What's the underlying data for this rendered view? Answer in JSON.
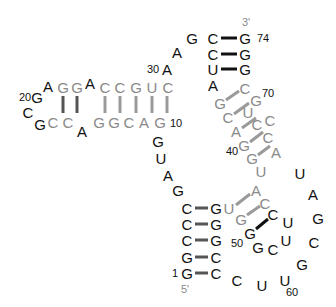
{
  "diagram": {
    "type": "RNA secondary structure (tRNA-like)",
    "colors": {
      "black": "#111111",
      "grey": "#8a8a8a",
      "bond_dark": "#555555",
      "bond_black": "#111111",
      "bond_grey": "#9a9a9a"
    },
    "ends": [
      {
        "label": "3'",
        "x": 246,
        "y": 22
      },
      {
        "label": "5'",
        "x": 185,
        "y": 289
      }
    ],
    "numbers": [
      {
        "label": "74",
        "x": 263,
        "y": 38
      },
      {
        "label": "30",
        "x": 153,
        "y": 69
      },
      {
        "label": "70",
        "x": 268,
        "y": 93
      },
      {
        "label": "20",
        "x": 25,
        "y": 97
      },
      {
        "label": "10",
        "x": 176,
        "y": 123
      },
      {
        "label": "40",
        "x": 232,
        "y": 151
      },
      {
        "label": "50",
        "x": 237,
        "y": 243
      },
      {
        "label": "1",
        "x": 175,
        "y": 273
      },
      {
        "label": "60",
        "x": 292,
        "y": 292
      }
    ],
    "nucleotides": [
      {
        "b": "G",
        "x": 187,
        "y": 273,
        "c": "black"
      },
      {
        "b": "G",
        "x": 187,
        "y": 257,
        "c": "black"
      },
      {
        "b": "C",
        "x": 187,
        "y": 240,
        "c": "black"
      },
      {
        "b": "C",
        "x": 187,
        "y": 224,
        "c": "black"
      },
      {
        "b": "C",
        "x": 187,
        "y": 208,
        "c": "black"
      },
      {
        "b": "G",
        "x": 178,
        "y": 190,
        "c": "black"
      },
      {
        "b": "A",
        "x": 168,
        "y": 175,
        "c": "black"
      },
      {
        "b": "U",
        "x": 161,
        "y": 158,
        "c": "black"
      },
      {
        "b": "G",
        "x": 158,
        "y": 141,
        "c": "black"
      },
      {
        "b": "G",
        "x": 160,
        "y": 122,
        "c": "grey"
      },
      {
        "b": "A",
        "x": 144,
        "y": 122,
        "c": "grey"
      },
      {
        "b": "C",
        "x": 129,
        "y": 122,
        "c": "grey"
      },
      {
        "b": "G",
        "x": 114,
        "y": 122,
        "c": "grey"
      },
      {
        "b": "G",
        "x": 99,
        "y": 122,
        "c": "grey"
      },
      {
        "b": "A",
        "x": 82,
        "y": 131,
        "c": "black"
      },
      {
        "b": "C",
        "x": 68,
        "y": 122,
        "c": "grey"
      },
      {
        "b": "C",
        "x": 53,
        "y": 122,
        "c": "grey"
      },
      {
        "b": "G",
        "x": 40,
        "y": 124,
        "c": "black"
      },
      {
        "b": "C",
        "x": 28,
        "y": 112,
        "c": "black"
      },
      {
        "b": "G",
        "x": 37,
        "y": 97,
        "c": "black"
      },
      {
        "b": "A",
        "x": 48,
        "y": 86,
        "c": "black"
      },
      {
        "b": "G",
        "x": 63,
        "y": 87,
        "c": "grey"
      },
      {
        "b": "G",
        "x": 77,
        "y": 87,
        "c": "grey"
      },
      {
        "b": "A",
        "x": 90,
        "y": 83,
        "c": "black"
      },
      {
        "b": "C",
        "x": 105,
        "y": 87,
        "c": "grey"
      },
      {
        "b": "C",
        "x": 120,
        "y": 87,
        "c": "grey"
      },
      {
        "b": "G",
        "x": 136,
        "y": 87,
        "c": "grey"
      },
      {
        "b": "U",
        "x": 152,
        "y": 87,
        "c": "grey"
      },
      {
        "b": "C",
        "x": 168,
        "y": 87,
        "c": "grey"
      },
      {
        "b": "A",
        "x": 167,
        "y": 69,
        "c": "black"
      },
      {
        "b": "A",
        "x": 177,
        "y": 52,
        "c": "black"
      },
      {
        "b": "G",
        "x": 192,
        "y": 38,
        "c": "black"
      },
      {
        "b": "C",
        "x": 213,
        "y": 38,
        "c": "black"
      },
      {
        "b": "C",
        "x": 213,
        "y": 54,
        "c": "black"
      },
      {
        "b": "U",
        "x": 213,
        "y": 69,
        "c": "black"
      },
      {
        "b": "A",
        "x": 213,
        "y": 85,
        "c": "black"
      },
      {
        "b": "G",
        "x": 220,
        "y": 103,
        "c": "grey"
      },
      {
        "b": "C",
        "x": 228,
        "y": 117,
        "c": "grey"
      },
      {
        "b": "A",
        "x": 236,
        "y": 131,
        "c": "grey"
      },
      {
        "b": "G",
        "x": 244,
        "y": 145,
        "c": "grey"
      },
      {
        "b": "G",
        "x": 252,
        "y": 158,
        "c": "grey"
      },
      {
        "b": "U",
        "x": 261,
        "y": 171,
        "c": "grey"
      },
      {
        "b": "A",
        "x": 256,
        "y": 190,
        "c": "grey"
      },
      {
        "b": "C",
        "x": 265,
        "y": 203,
        "c": "grey"
      },
      {
        "b": "U",
        "x": 300,
        "y": 173,
        "c": "black"
      },
      {
        "b": "A",
        "x": 313,
        "y": 194,
        "c": "black"
      },
      {
        "b": "G",
        "x": 318,
        "y": 218,
        "c": "black"
      },
      {
        "b": "C",
        "x": 314,
        "y": 242,
        "c": "black"
      },
      {
        "b": "G",
        "x": 302,
        "y": 264,
        "c": "black"
      },
      {
        "b": "U",
        "x": 285,
        "y": 280,
        "c": "black"
      },
      {
        "b": "U",
        "x": 262,
        "y": 285,
        "c": "black"
      },
      {
        "b": "C",
        "x": 237,
        "y": 280,
        "c": "black"
      },
      {
        "b": "C",
        "x": 216,
        "y": 273,
        "c": "black"
      },
      {
        "b": "C",
        "x": 216,
        "y": 257,
        "c": "black"
      },
      {
        "b": "G",
        "x": 216,
        "y": 240,
        "c": "black"
      },
      {
        "b": "G",
        "x": 216,
        "y": 224,
        "c": "black"
      },
      {
        "b": "G",
        "x": 216,
        "y": 208,
        "c": "black"
      },
      {
        "b": "U",
        "x": 229,
        "y": 208,
        "c": "grey"
      },
      {
        "b": "G",
        "x": 241,
        "y": 219,
        "c": "grey"
      },
      {
        "b": "G",
        "x": 250,
        "y": 233,
        "c": "black"
      },
      {
        "b": "G",
        "x": 258,
        "y": 247,
        "c": "black"
      },
      {
        "b": "C",
        "x": 273,
        "y": 249,
        "c": "black"
      },
      {
        "b": "U",
        "x": 286,
        "y": 240,
        "c": "black"
      },
      {
        "b": "U",
        "x": 288,
        "y": 222,
        "c": "black"
      },
      {
        "b": "C",
        "x": 273,
        "y": 214,
        "c": "black"
      },
      {
        "b": "C",
        "x": 270,
        "y": 120,
        "c": "grey"
      },
      {
        "b": "A",
        "x": 276,
        "y": 152,
        "c": "grey"
      },
      {
        "b": "C",
        "x": 268,
        "y": 137,
        "c": "grey"
      },
      {
        "b": "C",
        "x": 257,
        "y": 124,
        "c": "grey"
      },
      {
        "b": "U",
        "x": 248,
        "y": 112,
        "c": "grey"
      },
      {
        "b": "G",
        "x": 256,
        "y": 100,
        "c": "grey"
      },
      {
        "b": "C",
        "x": 245,
        "y": 88,
        "c": "grey"
      },
      {
        "b": "G",
        "x": 245,
        "y": 69,
        "c": "black"
      },
      {
        "b": "G",
        "x": 245,
        "y": 54,
        "c": "black"
      },
      {
        "b": "G",
        "x": 245,
        "y": 38,
        "c": "black"
      }
    ],
    "bonds": [
      {
        "x1": 195,
        "y1": 208,
        "x2": 208,
        "y2": 208,
        "c": "bond_dark",
        "w": 3
      },
      {
        "x1": 195,
        "y1": 224,
        "x2": 208,
        "y2": 224,
        "c": "bond_dark",
        "w": 3
      },
      {
        "x1": 195,
        "y1": 240,
        "x2": 208,
        "y2": 240,
        "c": "bond_dark",
        "w": 3
      },
      {
        "x1": 195,
        "y1": 257,
        "x2": 208,
        "y2": 257,
        "c": "bond_dark",
        "w": 3
      },
      {
        "x1": 195,
        "y1": 273,
        "x2": 208,
        "y2": 273,
        "c": "bond_dark",
        "w": 3
      },
      {
        "x1": 221,
        "y1": 38,
        "x2": 237,
        "y2": 38,
        "c": "bond_black",
        "w": 3
      },
      {
        "x1": 221,
        "y1": 54,
        "x2": 237,
        "y2": 54,
        "c": "bond_black",
        "w": 3
      },
      {
        "x1": 221,
        "y1": 69,
        "x2": 237,
        "y2": 69,
        "c": "bond_black",
        "w": 3
      },
      {
        "x1": 105,
        "y1": 96,
        "x2": 105,
        "y2": 113,
        "c": "bond_grey",
        "w": 3
      },
      {
        "x1": 120,
        "y1": 96,
        "x2": 120,
        "y2": 113,
        "c": "bond_grey",
        "w": 3
      },
      {
        "x1": 136,
        "y1": 96,
        "x2": 136,
        "y2": 113,
        "c": "bond_grey",
        "w": 3
      },
      {
        "x1": 152,
        "y1": 96,
        "x2": 152,
        "y2": 113,
        "c": "bond_grey",
        "w": 3
      },
      {
        "x1": 167,
        "y1": 96,
        "x2": 167,
        "y2": 113,
        "c": "bond_grey",
        "w": 3
      },
      {
        "x1": 63,
        "y1": 96,
        "x2": 63,
        "y2": 113,
        "c": "bond_dark",
        "w": 3
      },
      {
        "x1": 77,
        "y1": 96,
        "x2": 77,
        "y2": 113,
        "c": "bond_dark",
        "w": 3
      },
      {
        "x1": 226,
        "y1": 100,
        "x2": 239,
        "y2": 91,
        "c": "bond_grey",
        "w": 3
      },
      {
        "x1": 234,
        "y1": 114,
        "x2": 249,
        "y2": 103,
        "c": "bond_grey",
        "w": 3
      },
      {
        "x1": 242,
        "y1": 128,
        "x2": 256,
        "y2": 118,
        "c": "bond_grey",
        "w": 3
      },
      {
        "x1": 250,
        "y1": 142,
        "x2": 263,
        "y2": 132,
        "c": "bond_grey",
        "w": 3
      },
      {
        "x1": 258,
        "y1": 155,
        "x2": 270,
        "y2": 146,
        "c": "bond_grey",
        "w": 3
      },
      {
        "x1": 236,
        "y1": 205,
        "x2": 250,
        "y2": 194,
        "c": "bond_grey",
        "w": 3
      },
      {
        "x1": 247,
        "y1": 215,
        "x2": 260,
        "y2": 206,
        "c": "bond_grey",
        "w": 3
      },
      {
        "x1": 256,
        "y1": 229,
        "x2": 268,
        "y2": 219,
        "c": "bond_black",
        "w": 3
      }
    ]
  }
}
